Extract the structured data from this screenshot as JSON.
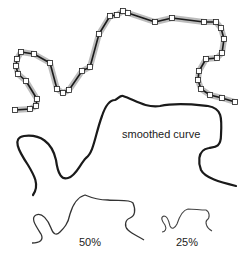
{
  "labels": {
    "smoothed": "smoothed curve",
    "half": "50%",
    "quarter": "25%"
  },
  "colors": {
    "curve": "#1a1a1a",
    "halo": "#a0a0a0",
    "marker_fill": "#ffffff",
    "marker_stroke": "#222222"
  },
  "original_polyline": {
    "points": [
      [
        15,
        110
      ],
      [
        30,
        109
      ],
      [
        36,
        106
      ],
      [
        37,
        99
      ],
      [
        26,
        81
      ],
      [
        18,
        74
      ],
      [
        16,
        66
      ],
      [
        17,
        59
      ],
      [
        21,
        52
      ],
      [
        34,
        54
      ],
      [
        50,
        63
      ],
      [
        57,
        89
      ],
      [
        63,
        93
      ],
      [
        69,
        90
      ],
      [
        82,
        71
      ],
      [
        90,
        67
      ],
      [
        99,
        34
      ],
      [
        110,
        16
      ],
      [
        117,
        15
      ],
      [
        123,
        11
      ],
      [
        128,
        13
      ],
      [
        155,
        22
      ],
      [
        172,
        18
      ],
      [
        204,
        22
      ],
      [
        216,
        22
      ],
      [
        221,
        28
      ],
      [
        224,
        39
      ],
      [
        222,
        53
      ],
      [
        217,
        58
      ],
      [
        206,
        59
      ],
      [
        199,
        71
      ],
      [
        198,
        80
      ],
      [
        201,
        89
      ],
      [
        210,
        95
      ],
      [
        222,
        98
      ],
      [
        235,
        102
      ]
    ]
  }
}
